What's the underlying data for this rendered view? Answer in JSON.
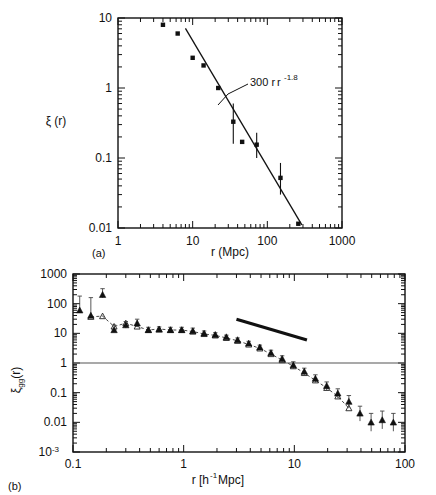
{
  "figure": {
    "panels": [
      {
        "tag": "(a)",
        "xlabel": "r (Mpc)",
        "ylabel": "ξ (r)",
        "xticklabels": [
          "1",
          "10",
          "100",
          "1000"
        ],
        "yticklabels": [
          "0.01",
          "0.1",
          "1",
          "10"
        ],
        "annotation": "300 r",
        "annotation_exponent": "-1.8"
      },
      {
        "tag": "(b)",
        "xlabel_main": "r  [h",
        "xlabel_exp": "-1",
        "xlabel_tail": " Mpc]",
        "ylabel_main": "ξ",
        "ylabel_sub": "gg",
        "ylabel_tail": "(r)",
        "xticklabels": [
          "0.1",
          "1",
          "10",
          "100"
        ],
        "yticklabels": [
          "10",
          "0.01",
          "0.1",
          "1",
          "10",
          "100",
          "1000"
        ],
        "ytick_first_label": "10",
        "ytick_first_exp": "-3"
      }
    ],
    "colors": {
      "ink": "#111111",
      "background": "#ffffff",
      "marker_filled": "#111111",
      "marker_open_stroke": "#333333"
    }
  },
  "chart_data": [
    {
      "type": "scatter",
      "panel": "a",
      "title": "",
      "xlabel": "r (Mpc)",
      "ylabel": "ξ (r)",
      "xscale": "log",
      "yscale": "log",
      "xlim": [
        1,
        1000
      ],
      "ylim": [
        0.01,
        10
      ],
      "grid": false,
      "legend": null,
      "series": [
        {
          "name": "cluster correlation function",
          "marker": "filled-square",
          "x": [
            4.0,
            6.3,
            10.0,
            14.0,
            22.0,
            35.0,
            46.0,
            72.0,
            150.0,
            260.0
          ],
          "y": [
            8.0,
            6.0,
            2.7,
            2.1,
            1.0,
            0.33,
            0.17,
            0.155,
            0.052,
            0.0115
          ],
          "yerr_low": [
            null,
            null,
            null,
            null,
            null,
            0.16,
            null,
            0.1,
            0.03,
            null
          ],
          "yerr_high": [
            null,
            null,
            null,
            null,
            null,
            0.6,
            null,
            0.23,
            0.085,
            null
          ]
        }
      ],
      "fit_line": {
        "label": "300 r^-1.8",
        "amplitude": 300,
        "slope": -1.8,
        "x_range": [
          8.0,
          290.0
        ]
      }
    },
    {
      "type": "scatter",
      "panel": "b",
      "title": "",
      "xlabel": "r [h^-1 Mpc]",
      "ylabel": "ξ_gg(r)",
      "xscale": "log",
      "yscale": "log",
      "xlim": [
        0.1,
        100
      ],
      "ylim": [
        0.001,
        1000
      ],
      "grid": false,
      "reference_hline": 1,
      "legend": null,
      "thick_reference_line": {
        "x_range": [
          3.0,
          13.0
        ],
        "y_range": [
          30.0,
          6.0
        ],
        "slope": -1.8
      },
      "series": [
        {
          "name": "galaxy correlation (filled triangles, with errors)",
          "marker": "filled-triangle",
          "x": [
            0.115,
            0.145,
            0.185,
            0.235,
            0.3,
            0.38,
            0.48,
            0.6,
            0.76,
            0.96,
            1.21,
            1.53,
            1.93,
            2.43,
            3.07,
            3.87,
            4.88,
            6.15,
            7.76,
            9.79,
            12.3,
            15.5,
            19.6,
            24.7,
            31.1,
            39.2,
            49.4,
            62.3,
            78.5
          ],
          "y": [
            60.0,
            40.0,
            200.0,
            13.0,
            19.0,
            22.0,
            13.0,
            13.5,
            13.0,
            13.0,
            12.0,
            10.0,
            9.0,
            7.5,
            6.0,
            4.6,
            3.4,
            2.2,
            1.4,
            0.85,
            0.52,
            0.3,
            0.17,
            0.095,
            0.05,
            0.02,
            0.01,
            0.012,
            0.01
          ],
          "yerr_low": [
            0.001,
            0.001,
            40.0,
            1.0,
            4.0,
            5.0,
            2.0,
            2.0,
            2.0,
            2.0,
            2.0,
            1.5,
            1.2,
            1.0,
            0.8,
            0.6,
            0.5,
            0.4,
            0.3,
            0.2,
            0.12,
            0.08,
            0.05,
            0.03,
            0.02,
            0.009,
            0.005,
            0.006,
            0.005
          ],
          "yerr_high": [
            120.0,
            120.0,
            120.0,
            6.0,
            6.0,
            8.0,
            3.0,
            3.0,
            3.0,
            3.0,
            3.0,
            2.0,
            1.5,
            1.2,
            1.0,
            0.8,
            0.6,
            0.5,
            0.35,
            0.25,
            0.15,
            0.1,
            0.06,
            0.04,
            0.03,
            0.015,
            0.01,
            0.012,
            0.01
          ]
        },
        {
          "name": "galaxy correlation (open triangles, dashed)",
          "marker": "open-triangle",
          "x": [
            0.145,
            0.185,
            0.235,
            0.3,
            0.38,
            0.48,
            0.6,
            0.76,
            0.96,
            1.21,
            1.53,
            1.93,
            2.43,
            3.07,
            3.87,
            4.88,
            6.15,
            7.76,
            9.79,
            12.3,
            15.5,
            19.6,
            24.7,
            31.1
          ],
          "y": [
            36.0,
            38.0,
            17.0,
            22.0,
            17.0,
            13.0,
            14.0,
            13.0,
            13.0,
            11.5,
            9.5,
            8.5,
            7.0,
            5.6,
            4.2,
            3.1,
            2.0,
            1.25,
            0.78,
            0.46,
            0.26,
            0.145,
            0.075,
            0.03
          ]
        }
      ]
    }
  ]
}
